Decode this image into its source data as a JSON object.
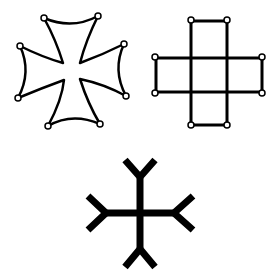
{
  "figure": {
    "colors": {
      "stroke": "#000000",
      "background": "#ffffff"
    },
    "items": [
      {
        "id": "cross-pattee",
        "label": "Curved-arm cross with circled terminals"
      },
      {
        "id": "greek-cross-squares",
        "label": "Greek cross made of five squares with circled terminals"
      },
      {
        "id": "forked-cross",
        "label": "Cross with forked (Y-shaped) arm ends"
      }
    ]
  }
}
